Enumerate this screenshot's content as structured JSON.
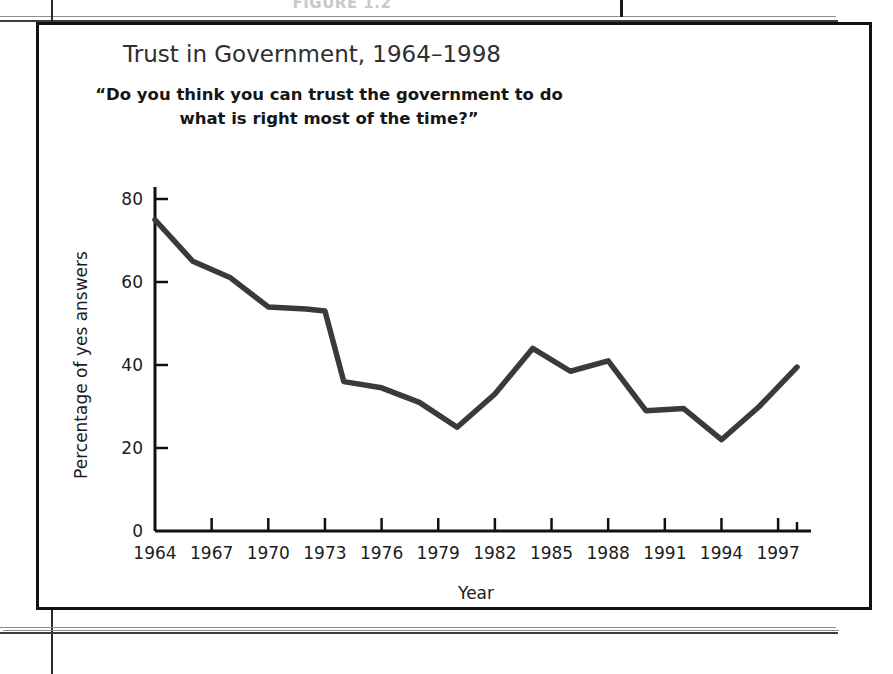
{
  "page": {
    "figure_caption": "FIGURE 1.2"
  },
  "chart_data": {
    "type": "line",
    "title": "Trust in Government, 1964–1998",
    "subtitle_line1": "“Do you think you can trust the government to do",
    "subtitle_line2": "what is right most of the time?”",
    "xlabel": "Year",
    "ylabel": "Percentage of yes answers",
    "xlim": [
      1964,
      1998
    ],
    "ylim": [
      0,
      80
    ],
    "grid": false,
    "legend": "none",
    "line_color": "#3a3a3a",
    "xtick_labels": [
      "1964",
      "1967",
      "1970",
      "1973",
      "1976",
      "1979",
      "1982",
      "1985",
      "1988",
      "1991",
      "1994",
      "1997"
    ],
    "xticks": [
      1964,
      1967,
      1970,
      1973,
      1976,
      1979,
      1982,
      1985,
      1988,
      1991,
      1994,
      1997
    ],
    "ytick_labels": [
      "0",
      "20",
      "40",
      "60",
      "80"
    ],
    "yticks": [
      0,
      20,
      40,
      60,
      80
    ],
    "x": [
      1964,
      1966,
      1968,
      1970,
      1972,
      1973,
      1974,
      1976,
      1978,
      1980,
      1982,
      1984,
      1986,
      1988,
      1990,
      1992,
      1994,
      1996,
      1998
    ],
    "values": [
      75,
      65,
      61,
      54,
      53.5,
      53,
      36,
      34.5,
      31,
      25,
      33,
      44,
      38.5,
      41,
      29,
      29.5,
      22,
      30,
      39.5
    ],
    "series": [
      {
        "name": "Percentage of yes answers",
        "values": [
          75,
          65,
          61,
          54,
          53.5,
          53,
          36,
          34.5,
          31,
          25,
          33,
          44,
          38.5,
          41,
          29,
          29.5,
          22,
          30,
          39.5
        ]
      }
    ]
  }
}
